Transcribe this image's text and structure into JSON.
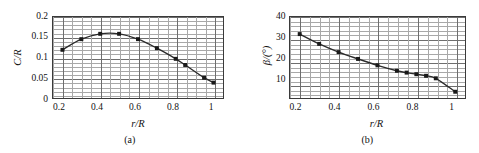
{
  "figure": {
    "panels": [
      {
        "caption": "(a)",
        "xlabel": "r/R",
        "ylabel": "C/R",
        "ytick_labels": [
          "0.2",
          "0.15",
          "0.1",
          "0.05",
          "0"
        ],
        "xtick_labels": [
          "0.2",
          "0.4",
          "0.6",
          "0.8",
          "1"
        ]
      },
      {
        "caption": "(b)",
        "xlabel": "r/R",
        "ylabel": "β/(°)",
        "ytick_labels": [
          "40",
          "30",
          "20",
          "10"
        ],
        "xtick_labels": [
          "0.2",
          "0.4",
          "0.6",
          "0.8",
          "1"
        ]
      }
    ]
  },
  "chart_data": [
    {
      "type": "line",
      "title": "",
      "panel_label": "(a)",
      "xlabel": "r/R",
      "ylabel": "C/R",
      "xlim": [
        0.15,
        1.05
      ],
      "ylim": [
        0,
        0.2
      ],
      "xticks": [
        0.2,
        0.4,
        0.6,
        0.8,
        1.0
      ],
      "yticks": [
        0,
        0.05,
        0.1,
        0.15,
        0.2
      ],
      "grid": true,
      "grid_minor": true,
      "legend": "none",
      "marker": "square",
      "series": [
        {
          "name": "C/R",
          "x": [
            0.2,
            0.3,
            0.4,
            0.5,
            0.6,
            0.7,
            0.8,
            0.85,
            0.95,
            1.0
          ],
          "values": [
            0.12,
            0.146,
            0.159,
            0.159,
            0.146,
            0.124,
            0.098,
            0.083,
            0.052,
            0.04
          ]
        }
      ]
    },
    {
      "type": "line",
      "title": "",
      "panel_label": "(b)",
      "xlabel": "r/R",
      "ylabel": "β/(°)",
      "xlim": [
        0.15,
        1.05
      ],
      "ylim": [
        4,
        40
      ],
      "xticks": [
        0.2,
        0.4,
        0.6,
        0.8,
        1.0
      ],
      "yticks": [
        10,
        20,
        30,
        40
      ],
      "grid": true,
      "grid_minor": true,
      "legend": "none",
      "marker": "square",
      "series": [
        {
          "name": "β",
          "x": [
            0.2,
            0.3,
            0.4,
            0.5,
            0.6,
            0.7,
            0.75,
            0.8,
            0.85,
            0.9,
            1.0
          ],
          "values": [
            32.5,
            28.2,
            24.6,
            21.6,
            18.8,
            16.4,
            15.6,
            14.9,
            14.2,
            13.1,
            7.2
          ]
        }
      ]
    }
  ],
  "colors": {
    "line": "#2b2b2b",
    "marker": "#1a1a1a",
    "grid_minor": "#a8a8a8",
    "grid_major": "#6e6e6e",
    "frame": "#3a3a3a",
    "background": "#ffffff"
  }
}
